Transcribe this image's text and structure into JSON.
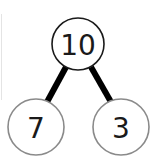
{
  "diagram": {
    "type": "number-bond",
    "whole": {
      "label": "10"
    },
    "parts": [
      {
        "label": "7"
      },
      {
        "label": "3"
      }
    ],
    "colors": {
      "whole_stroke": "#1a1a1a",
      "part_stroke": "#8a8a8a",
      "connector": "#000000",
      "text": "#1a1a1a"
    }
  }
}
